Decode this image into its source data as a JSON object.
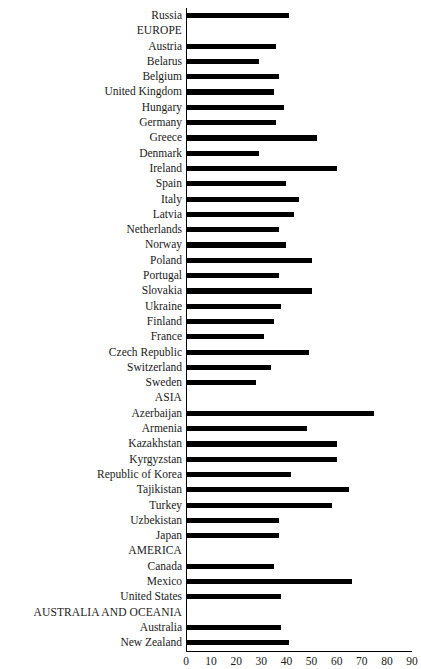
{
  "title_remnant": "",
  "chart_data": {
    "type": "bar",
    "orientation": "horizontal",
    "title": "",
    "xlabel": "",
    "ylabel": "",
    "xlim": [
      0,
      90
    ],
    "xticks": [
      0,
      10,
      20,
      30,
      40,
      50,
      60,
      70,
      80,
      90
    ],
    "grid": false,
    "legend": null,
    "bar_color": "#000000",
    "categories": [
      "Russia",
      "EUROPE",
      "Austria",
      "Belarus",
      "Belgium",
      "United Kingdom",
      "Hungary",
      "Germany",
      "Greece",
      "Denmark",
      "Ireland",
      "Spain",
      "Italy",
      "Latvia",
      "Netherlands",
      "Norway",
      "Poland",
      "Portugal",
      "Slovakia",
      "Ukraine",
      "Finland",
      "France",
      "Czech Republic",
      "Switzerland",
      "Sweden",
      "ASIA",
      "Azerbaijan",
      "Armenia",
      "Kazakhstan",
      "Kyrgyzstan",
      "Republic of Korea",
      "Tajikistan",
      "Turkey",
      "Uzbekistan",
      "Japan",
      "AMERICA",
      "Canada",
      "Mexico",
      "United States",
      "AUSTRALIA AND OCEANIA",
      "Australia",
      "New Zealand"
    ],
    "values": [
      41,
      null,
      36,
      29,
      37,
      35,
      39,
      36,
      52,
      29,
      60,
      40,
      45,
      43,
      37,
      40,
      50,
      37,
      50,
      38,
      35,
      31,
      49,
      34,
      28,
      null,
      75,
      48,
      60,
      60,
      42,
      65,
      58,
      37,
      37,
      null,
      35,
      66,
      38,
      null,
      38,
      41
    ],
    "group_rows": [
      "EUROPE",
      "ASIA",
      "AMERICA",
      "AUSTRALIA AND OCEANIA"
    ]
  }
}
